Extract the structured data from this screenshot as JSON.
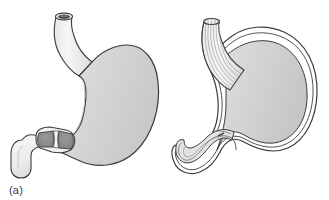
{
  "figure": {
    "type": "anatomical-illustration",
    "background_color": "#ffffff",
    "width": 329,
    "height": 200
  },
  "colors": {
    "organ_fill_light": "#f2f2f2",
    "organ_fill_body": "#d6d6d6",
    "organ_fill_body_dark": "#c8c8c8",
    "wall_fill": "#ededed",
    "sphincter_muscle": "#8c8c8c",
    "lumen_dark": "#5a5a5a",
    "outline": "#3d3d3d",
    "inner_line": "#7a7a7a",
    "label_color": "#3a3a3a"
  },
  "panels": [
    {
      "id": "a",
      "label": "(a)",
      "caption_text": "(a)",
      "description": "Stomach with esophagus at top, fundus and body, pylorus with constricted pyloric sphincter shown as two dark muscular wedges, duodenum at lower left",
      "parts": [
        {
          "name": "esophagus",
          "label": "esophagus"
        },
        {
          "name": "esophageal-opening",
          "label": "esophageal opening"
        },
        {
          "name": "fundus",
          "label": "fundus"
        },
        {
          "name": "body",
          "label": "body"
        },
        {
          "name": "antrum",
          "label": "antrum"
        },
        {
          "name": "pyloric-sphincter",
          "label": "pyloric sphincter (contracted)"
        },
        {
          "name": "duodenum",
          "label": "duodenum"
        }
      ]
    },
    {
      "id": "b",
      "label": "(b)",
      "caption_text": "(b)",
      "description": "Stomach in cutaway section showing wall layers, longitudinal rugae in the esophagus, and the pyloric canal opened with folded mucosa at the lower left",
      "parts": [
        {
          "name": "esophagus-cutaway",
          "label": "esophagus (cut away)"
        },
        {
          "name": "rugae",
          "label": "rugae / longitudinal folds"
        },
        {
          "name": "stomach-wall",
          "label": "stomach wall"
        },
        {
          "name": "gastric-lumen",
          "label": "gastric lumen"
        },
        {
          "name": "pyloric-canal",
          "label": "pyloric canal (open)"
        },
        {
          "name": "duodenum-cutaway",
          "label": "duodenum (cut away)"
        }
      ]
    }
  ]
}
